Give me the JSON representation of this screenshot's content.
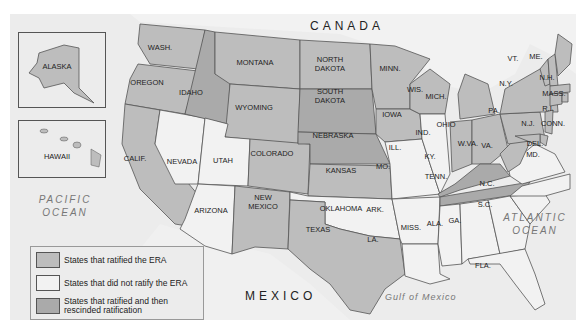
{
  "colors": {
    "ratified": "#bdbdbd",
    "not_ratified": "#f2f2f2",
    "rescinded": "#aaaaaa",
    "water": "#ececec",
    "foreign": "#e8e8e8"
  },
  "labels": {
    "canada": "CANADA",
    "mexico": "MEXICO",
    "pacific": [
      "PACIFIC",
      "OCEAN"
    ],
    "atlantic": [
      "ATLANTIC",
      "OCEAN"
    ],
    "gulf": "Gulf of Mexico"
  },
  "insets": {
    "alaska": "ALASKA",
    "hawaii": "HAWAII"
  },
  "states": {
    "ratified": [
      "WASH.",
      "OREGON",
      "CALIF.",
      "MONTANA",
      "WYOMING",
      "COLORADO",
      "NEW MEXICO",
      "TEXAS",
      "KANSAS",
      "NORTH DAKOTA",
      "IOWA",
      "MINN.",
      "WIS.",
      "MICH.",
      "IND.",
      "OHIO",
      "W.VA.",
      "PA.",
      "N.Y.",
      "VT.",
      "N.H.",
      "ME.",
      "MASS.",
      "R.I.",
      "CONN.",
      "N.J.",
      "DEL.",
      "MD.",
      "ALASKA",
      "HAWAII"
    ],
    "not_ratified": [
      "NEVADA",
      "UTAH",
      "ARIZONA",
      "OKLAHOMA",
      "MO.",
      "ARK.",
      "LA.",
      "ILL.",
      "MISS.",
      "ALA.",
      "GA.",
      "FLA.",
      "S.C.",
      "N.C.",
      "VA."
    ],
    "rescinded": [
      "IDAHO",
      "NEBRASKA",
      "SOUTH DAKOTA",
      "KY.",
      "TENN."
    ]
  },
  "legend": {
    "items": [
      {
        "label": "States that ratified the ERA",
        "color": "#bdbdbd"
      },
      {
        "label": "States that did not ratify the ERA",
        "color": "#f2f2f2"
      },
      {
        "label": "States that ratified and then rescinded ratification",
        "color": "#aaaaaa"
      }
    ]
  }
}
